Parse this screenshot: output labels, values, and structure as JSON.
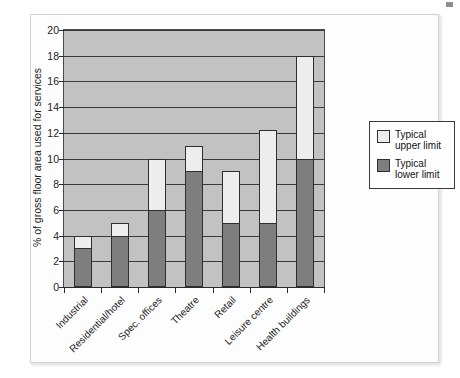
{
  "chart_data": {
    "type": "bar",
    "subtype": "stacked-range",
    "title": "",
    "xlabel": "",
    "ylabel": "% of gross floor area used for services",
    "ylim": [
      0,
      20
    ],
    "ytick_step": 2,
    "yticks": [
      "0",
      "2",
      "4",
      "6",
      "8",
      "10",
      "12",
      "14",
      "16",
      "18",
      "20"
    ],
    "grid": "horizontal",
    "legend_position": "right",
    "legend": [
      "Typical upper limit",
      "Typical lower limit"
    ],
    "categories": [
      "Industrial",
      "Residential/hotel",
      "Spec. offices",
      "Theatre",
      "Retail",
      "Leisure centre",
      "Health buildings"
    ],
    "series": [
      {
        "name": "Typical lower limit",
        "color": "#7e7e7e",
        "values": [
          3,
          4,
          6,
          9,
          5,
          5,
          10
        ]
      },
      {
        "name": "Typical upper limit",
        "color": "#ededed",
        "values": [
          4,
          5,
          10,
          11,
          9,
          12.2,
          18
        ]
      }
    ],
    "bars": [
      {
        "category": "Industrial",
        "lower": 3,
        "upper": 4
      },
      {
        "category": "Residential/hotel",
        "lower": 4,
        "upper": 5
      },
      {
        "category": "Spec. offices",
        "lower": 6,
        "upper": 10
      },
      {
        "category": "Theatre",
        "lower": 9,
        "upper": 11
      },
      {
        "category": "Retail",
        "lower": 5,
        "upper": 9
      },
      {
        "category": "Leisure centre",
        "lower": 5,
        "upper": 12.2
      },
      {
        "category": "Health buildings",
        "lower": 10,
        "upper": 18
      }
    ],
    "colors": {
      "plot_background": "#c2c2c2",
      "gridline": "#3a3a3a",
      "axis": "#2b2b2b",
      "upper_fill": "#ededed",
      "lower_fill": "#7e7e7e",
      "bar_outline": "#2f2f2f",
      "figure_background": "#fdfdfd",
      "frame_border": "#d2d2d2"
    }
  }
}
